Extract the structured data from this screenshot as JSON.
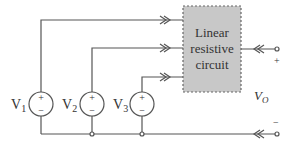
{
  "diagram": {
    "box": {
      "label_lines": [
        "Linear",
        "resistive",
        "circuit"
      ],
      "fill": "#c8c8c8",
      "border": "#666666"
    },
    "sources": [
      {
        "name": "V1",
        "label": "V",
        "sub": "1",
        "plus": "+",
        "minus": "−"
      },
      {
        "name": "V2",
        "label": "V",
        "sub": "2",
        "plus": "+",
        "minus": "−"
      },
      {
        "name": "V3",
        "label": "V",
        "sub": "3",
        "plus": "+",
        "minus": "−"
      }
    ],
    "output": {
      "label": "V",
      "sub": "O",
      "plus": "+",
      "minus": "−"
    },
    "colors": {
      "wire": "#555555",
      "box_fill": "#c8c8c8"
    }
  }
}
